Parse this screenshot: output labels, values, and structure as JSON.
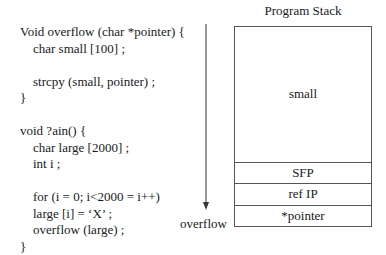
{
  "code": {
    "lines": [
      "Void overflow (char *pointer) {",
      "    char small [100] ;",
      "",
      "    strcpy (small, pointer) ;",
      "}",
      "",
      "void ?ain() {",
      "    char large [2000] ;",
      "    int i ;",
      "",
      "    for (i = 0; i<2000 = i++)",
      "    large [i] = ‘X’ ;",
      "    overflow (large) ;",
      "}"
    ]
  },
  "stack": {
    "title": "Program Stack",
    "cells": [
      "small",
      "SFP",
      "ref IP",
      "*pointer"
    ]
  },
  "arrow": {
    "label": "overflow",
    "direction": "down"
  },
  "colors": {
    "line": "#555555",
    "text": "#1a1a1a"
  }
}
